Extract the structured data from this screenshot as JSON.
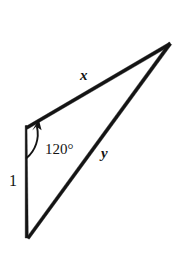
{
  "figure": {
    "type": "geometry-diagram",
    "shape": "triangle",
    "background_color": "#ffffff",
    "stroke_color": "#141414",
    "labels": {
      "side_x": "x",
      "side_y": "y",
      "side_one": "1",
      "angle": "120°"
    },
    "vertices": {
      "top_left": {
        "x": 26,
        "y": 126
      },
      "bottom_left": {
        "x": 27,
        "y": 238
      },
      "apex_right": {
        "x": 170,
        "y": 43
      }
    },
    "sides": [
      {
        "name": "x",
        "from": "top_left",
        "to": "apex_right",
        "label": "x"
      },
      {
        "name": "y",
        "from": "bottom_left",
        "to": "apex_right",
        "label": "y"
      },
      {
        "name": "1",
        "from": "top_left",
        "to": "bottom_left",
        "label": "1"
      }
    ],
    "angle_marker": {
      "label": "120°",
      "vertex": "top_left",
      "measure_degrees": 120,
      "direction": "counterclockwise",
      "has_arrowhead": true
    }
  }
}
